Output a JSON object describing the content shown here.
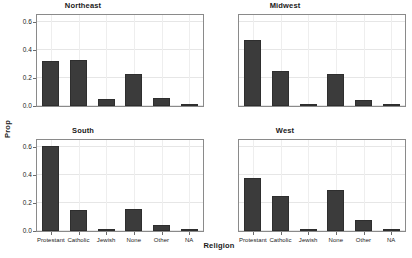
{
  "chart_data": {
    "type": "bar",
    "title": "",
    "xlabel": "Religion",
    "ylabel": "Prop",
    "ylim": [
      0,
      0.65
    ],
    "yticks": [
      "0.0",
      "0.2",
      "0.4",
      "0.6"
    ],
    "ytick_values": [
      0.0,
      0.2,
      0.4,
      0.6
    ],
    "grid": true,
    "legend": "none",
    "categories": [
      "Protestant",
      "Catholic",
      "Jewish",
      "None",
      "Other",
      "NA"
    ],
    "facets": [
      {
        "title": "Northeast",
        "values": [
          0.32,
          0.33,
          0.05,
          0.23,
          0.055,
          0.01
        ]
      },
      {
        "title": "Midwest",
        "values": [
          0.47,
          0.25,
          0.008,
          0.23,
          0.04,
          0.005
        ]
      },
      {
        "title": "South",
        "values": [
          0.61,
          0.15,
          0.01,
          0.16,
          0.045,
          0.008
        ]
      },
      {
        "title": "West",
        "values": [
          0.38,
          0.25,
          0.012,
          0.29,
          0.08,
          0.008
        ]
      }
    ],
    "colors": {
      "bar": "#3b3b3b",
      "grid": "#e6e6e6",
      "panel_border": "#8a8a8a",
      "background": "#ffffff",
      "text": "#1a1a1a"
    }
  }
}
